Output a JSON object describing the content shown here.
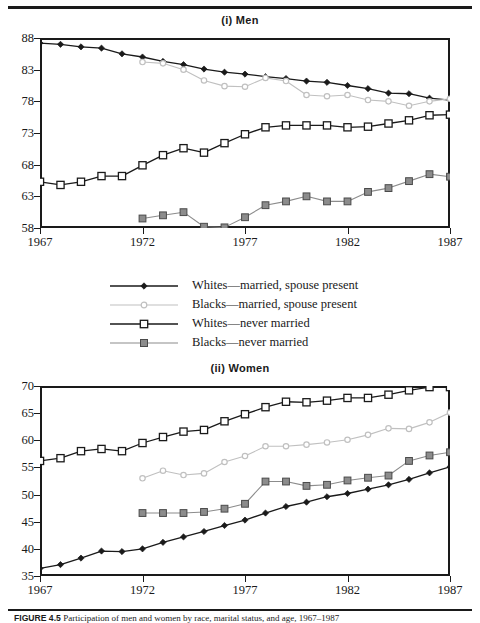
{
  "figure": {
    "caption_label": "FIGURE 4.5",
    "caption_text": "Participation of men and women by race, marital status, and age, 1967–1987"
  },
  "legend": {
    "items": [
      {
        "label": "Whites—married, spouse present",
        "key": "line-filled-diamond",
        "color": "#1a1a1a",
        "marker": "filled-diamond"
      },
      {
        "label": "Blacks—married, spouse present",
        "key": "line-open-circle",
        "color": "#c0c0c0",
        "marker": "open-circle"
      },
      {
        "label": "Whites—never married",
        "key": "line-open-square",
        "color": "#1a1a1a",
        "marker": "open-square"
      },
      {
        "label": "Blacks—never married",
        "key": "line-filled-square",
        "color": "#8c8c8c",
        "marker": "filled-square"
      }
    ]
  },
  "chart_data": [
    {
      "type": "line",
      "title": "(i) Men",
      "xlabel": "",
      "ylabel": "",
      "x": [
        1967,
        1968,
        1969,
        1970,
        1971,
        1972,
        1973,
        1974,
        1975,
        1976,
        1977,
        1978,
        1979,
        1980,
        1981,
        1982,
        1983,
        1984,
        1985,
        1986,
        1987
      ],
      "xlim": [
        1967,
        1987
      ],
      "ylim": [
        58,
        88
      ],
      "xticks": [
        1967,
        1972,
        1977,
        1982,
        1987
      ],
      "yticks": [
        58,
        63,
        68,
        73,
        78,
        83,
        88
      ],
      "grid": false,
      "legend_position": "below-panel",
      "series": [
        {
          "name": "Whites—married, spouse present",
          "color": "#1a1a1a",
          "marker": "filled-diamond",
          "values": [
            87.2,
            87.0,
            86.6,
            86.4,
            85.5,
            85.0,
            84.3,
            83.8,
            83.1,
            82.6,
            82.3,
            81.9,
            81.6,
            81.2,
            81.0,
            80.5,
            80.0,
            79.3,
            79.2,
            78.5,
            78.2
          ]
        },
        {
          "name": "Blacks—married, spouse present",
          "color": "#c0c0c0",
          "marker": "open-circle",
          "values": [
            null,
            null,
            null,
            null,
            null,
            84.2,
            84.0,
            83.0,
            81.3,
            80.4,
            80.3,
            81.7,
            81.2,
            79.0,
            78.8,
            79.0,
            78.2,
            78.0,
            77.3,
            78.0,
            78.4
          ]
        },
        {
          "name": "Whites—never married",
          "color": "#1a1a1a",
          "marker": "open-square",
          "values": [
            65.3,
            64.8,
            65.3,
            66.2,
            66.2,
            67.9,
            69.5,
            70.6,
            69.9,
            71.4,
            72.8,
            73.9,
            74.2,
            74.2,
            74.2,
            73.9,
            74.0,
            74.5,
            75.0,
            75.8,
            75.9
          ]
        },
        {
          "name": "Blacks—never married",
          "color": "#8c8c8c",
          "marker": "filled-square",
          "values": [
            null,
            null,
            null,
            null,
            null,
            59.5,
            60.0,
            60.5,
            58.2,
            58.1,
            59.7,
            61.6,
            62.2,
            63.0,
            62.2,
            62.2,
            63.7,
            64.3,
            65.4,
            66.5,
            66.1
          ]
        }
      ]
    },
    {
      "type": "line",
      "title": "(ii) Women",
      "xlabel": "",
      "ylabel": "",
      "x": [
        1967,
        1968,
        1969,
        1970,
        1971,
        1972,
        1973,
        1974,
        1975,
        1976,
        1977,
        1978,
        1979,
        1980,
        1981,
        1982,
        1983,
        1984,
        1985,
        1986,
        1987
      ],
      "xlim": [
        1967,
        1987
      ],
      "ylim": [
        35,
        70
      ],
      "xticks": [
        1967,
        1972,
        1977,
        1982,
        1987
      ],
      "yticks": [
        35,
        40,
        45,
        50,
        55,
        60,
        65,
        70
      ],
      "grid": false,
      "legend_position": "above-panel",
      "series": [
        {
          "name": "Whites—married, spouse present",
          "color": "#1a1a1a",
          "marker": "filled-diamond",
          "values": [
            36.4,
            37.1,
            38.3,
            39.6,
            39.5,
            40.0,
            41.2,
            42.2,
            43.2,
            44.3,
            45.3,
            46.6,
            47.8,
            48.6,
            49.6,
            50.2,
            51.0,
            51.8,
            52.8,
            54.0,
            55.1
          ]
        },
        {
          "name": "Blacks—married, spouse present",
          "color": "#c0c0c0",
          "marker": "open-circle",
          "values": [
            null,
            null,
            null,
            null,
            null,
            53.0,
            54.4,
            53.6,
            53.9,
            56.0,
            57.1,
            58.9,
            58.9,
            59.2,
            59.6,
            60.1,
            61.0,
            62.2,
            62.1,
            63.3,
            65.1
          ]
        },
        {
          "name": "Whites—never married",
          "color": "#1a1a1a",
          "marker": "open-square",
          "values": [
            56.2,
            56.7,
            58.0,
            58.4,
            58.0,
            59.5,
            60.6,
            61.6,
            61.9,
            63.5,
            64.8,
            66.1,
            67.1,
            67.0,
            67.3,
            67.8,
            67.8,
            68.4,
            69.2,
            69.8,
            69.8
          ]
        },
        {
          "name": "Blacks—never married",
          "color": "#8c8c8c",
          "marker": "filled-square",
          "values": [
            null,
            null,
            null,
            null,
            null,
            46.6,
            46.6,
            46.6,
            46.8,
            47.4,
            48.3,
            52.4,
            52.4,
            51.6,
            51.8,
            52.6,
            53.1,
            53.5,
            56.2,
            57.2,
            57.8
          ]
        }
      ]
    }
  ]
}
